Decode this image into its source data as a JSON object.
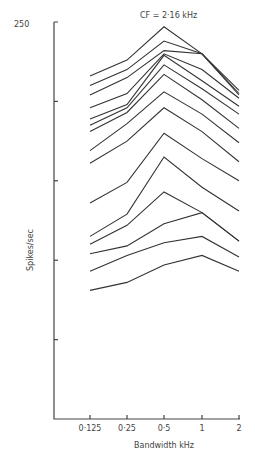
{
  "chart_data": {
    "type": "line",
    "title": "CF = 2·16 kHz",
    "xlabel": "Bandwidth kHz",
    "ylabel": "Spikes/sec",
    "x": [
      "0·125",
      "0·25",
      "0·5",
      "1",
      "2"
    ],
    "ylim": [
      0,
      250
    ],
    "yticks": [
      0,
      50,
      100,
      150,
      200,
      250
    ],
    "ytick_labels_shown": [
      "250"
    ],
    "grid": false,
    "legend": null,
    "series": [
      {
        "name": "curve-1",
        "values": [
          216,
          226,
          247,
          230,
          207
        ]
      },
      {
        "name": "curve-2",
        "values": [
          210,
          220,
          238,
          230,
          205
        ]
      },
      {
        "name": "curve-3",
        "values": [
          204,
          215,
          232,
          230,
          204
        ]
      },
      {
        "name": "curve-4",
        "values": [
          196,
          205,
          230,
          220,
          202
        ]
      },
      {
        "name": "curve-5",
        "values": [
          189,
          198,
          229,
          213,
          197
        ]
      },
      {
        "name": "curve-6",
        "values": [
          185,
          196,
          223,
          208,
          192
        ]
      },
      {
        "name": "curve-7",
        "values": [
          181,
          193,
          217,
          201,
          183
        ]
      },
      {
        "name": "curve-8",
        "values": [
          169,
          186,
          206,
          192,
          174
        ]
      },
      {
        "name": "curve-9",
        "values": [
          161,
          175,
          196,
          181,
          162
        ]
      },
      {
        "name": "curve-10",
        "values": [
          136,
          149,
          180,
          164,
          150
        ]
      },
      {
        "name": "curve-11",
        "values": [
          115,
          129,
          165,
          146,
          131
        ]
      },
      {
        "name": "curve-12",
        "values": [
          110,
          122,
          143,
          130,
          112
        ]
      },
      {
        "name": "curve-13",
        "values": [
          104,
          109,
          123,
          130,
          112
        ]
      },
      {
        "name": "curve-14",
        "values": [
          93,
          103,
          111,
          115,
          102
        ]
      },
      {
        "name": "curve-15",
        "values": [
          81,
          86,
          97,
          103,
          93
        ]
      }
    ]
  },
  "labels": {
    "title": "CF = 2·16 kHz",
    "ytop": "250",
    "ylabel": "Spikes/sec",
    "xlabel": "Bandwidth kHz",
    "xticks": [
      "0·125",
      "0·25",
      "0·5",
      "1",
      "2"
    ]
  }
}
